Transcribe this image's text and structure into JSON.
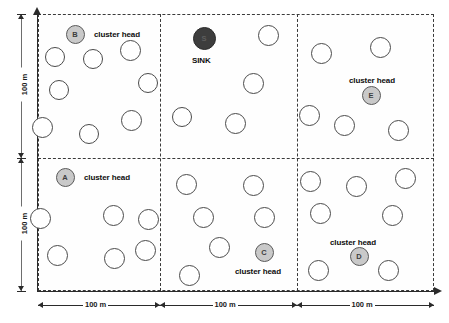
{
  "diagram": {
    "cluster_head_label": "cluster head",
    "sink_label": "SINK",
    "horizontal_dimensions": [
      "100 m",
      "100 m",
      "100 m"
    ],
    "vertical_dimensions": [
      "100 m",
      "100 m"
    ],
    "cluster_heads": [
      {
        "id": "A",
        "label": "A",
        "caption": "cluster head",
        "cell": "bottom-left",
        "x": 65,
        "y": 177,
        "r": 9.5,
        "caption_x": 84,
        "caption_y": 173
      },
      {
        "id": "B",
        "label": "B",
        "caption": "cluster head",
        "cell": "top-left",
        "x": 75,
        "y": 34,
        "r": 9.5,
        "caption_x": 94,
        "caption_y": 30
      },
      {
        "id": "C",
        "label": "C",
        "caption": "cluster head",
        "cell": "bottom-middle",
        "x": 264,
        "y": 252,
        "r": 9.5,
        "caption_x": 235,
        "caption_y": 267
      },
      {
        "id": "D",
        "label": "D",
        "caption": "cluster head",
        "cell": "bottom-right",
        "x": 359,
        "y": 256,
        "r": 9.5,
        "caption_x": 330,
        "caption_y": 238
      },
      {
        "id": "E",
        "label": "E",
        "caption": "cluster head",
        "cell": "top-right",
        "x": 371,
        "y": 95,
        "r": 9.5,
        "caption_x": 349,
        "caption_y": 76
      }
    ],
    "sink": {
      "id": "S",
      "label": "S",
      "caption": "SINK",
      "cell": "top-middle",
      "x": 204,
      "y": 38,
      "r": 11.5,
      "caption_x": 192,
      "caption_y": 56
    },
    "sensor_nodes": [
      {
        "cell": "top-left",
        "x": 55,
        "y": 57,
        "r": 10
      },
      {
        "cell": "top-left",
        "x": 93,
        "y": 59,
        "r": 10
      },
      {
        "cell": "top-left",
        "x": 130,
        "y": 50,
        "r": 10.5
      },
      {
        "cell": "top-left",
        "x": 59,
        "y": 90,
        "r": 10
      },
      {
        "cell": "top-left",
        "x": 148,
        "y": 83,
        "r": 10
      },
      {
        "cell": "top-left",
        "x": 42,
        "y": 127,
        "r": 10.5
      },
      {
        "cell": "top-left",
        "x": 89,
        "y": 134,
        "r": 10
      },
      {
        "cell": "top-left",
        "x": 131,
        "y": 120,
        "r": 10.5
      },
      {
        "cell": "top-middle",
        "x": 268,
        "y": 35,
        "r": 10.5
      },
      {
        "cell": "top-middle",
        "x": 253,
        "y": 83,
        "r": 10.5
      },
      {
        "cell": "top-middle",
        "x": 182,
        "y": 117,
        "r": 10
      },
      {
        "cell": "top-middle",
        "x": 235,
        "y": 123,
        "r": 10.5
      },
      {
        "cell": "top-right",
        "x": 321,
        "y": 53,
        "r": 10.5
      },
      {
        "cell": "top-right",
        "x": 380,
        "y": 47,
        "r": 10.5
      },
      {
        "cell": "top-right",
        "x": 309,
        "y": 115,
        "r": 10.5
      },
      {
        "cell": "top-right",
        "x": 344,
        "y": 125,
        "r": 10.5
      },
      {
        "cell": "top-right",
        "x": 398,
        "y": 130,
        "r": 10.5
      },
      {
        "cell": "bottom-left",
        "x": 40,
        "y": 218,
        "r": 10.5
      },
      {
        "cell": "bottom-left",
        "x": 113,
        "y": 215,
        "r": 10.5
      },
      {
        "cell": "bottom-left",
        "x": 148,
        "y": 219,
        "r": 10.5
      },
      {
        "cell": "bottom-left",
        "x": 57,
        "y": 255,
        "r": 10.5
      },
      {
        "cell": "bottom-left",
        "x": 114,
        "y": 258,
        "r": 10.5
      },
      {
        "cell": "bottom-left",
        "x": 145,
        "y": 250,
        "r": 10.5
      },
      {
        "cell": "bottom-middle",
        "x": 186,
        "y": 184,
        "r": 10.5
      },
      {
        "cell": "bottom-middle",
        "x": 253,
        "y": 185,
        "r": 10.5
      },
      {
        "cell": "bottom-middle",
        "x": 203,
        "y": 217,
        "r": 10.5
      },
      {
        "cell": "bottom-middle",
        "x": 264,
        "y": 217,
        "r": 10.5
      },
      {
        "cell": "bottom-middle",
        "x": 219,
        "y": 247,
        "r": 10.5
      },
      {
        "cell": "bottom-middle",
        "x": 189,
        "y": 275,
        "r": 10.5
      },
      {
        "cell": "bottom-right",
        "x": 310,
        "y": 181,
        "r": 10.5
      },
      {
        "cell": "bottom-right",
        "x": 356,
        "y": 186,
        "r": 10.5
      },
      {
        "cell": "bottom-right",
        "x": 405,
        "y": 178,
        "r": 10.5
      },
      {
        "cell": "bottom-right",
        "x": 320,
        "y": 213,
        "r": 10.5
      },
      {
        "cell": "bottom-right",
        "x": 392,
        "y": 215,
        "r": 10.5
      },
      {
        "cell": "bottom-right",
        "x": 318,
        "y": 270,
        "r": 10.5
      },
      {
        "cell": "bottom-right",
        "x": 388,
        "y": 270,
        "r": 10.5
      }
    ]
  },
  "colors": {
    "cluster_head_fill": "#c9c9c9",
    "sink_fill": "#3d3d3d",
    "node_stroke": "#4a4a4a",
    "grid_stroke": "#3a3a3a",
    "axis_stroke": "#2b2b2b"
  }
}
